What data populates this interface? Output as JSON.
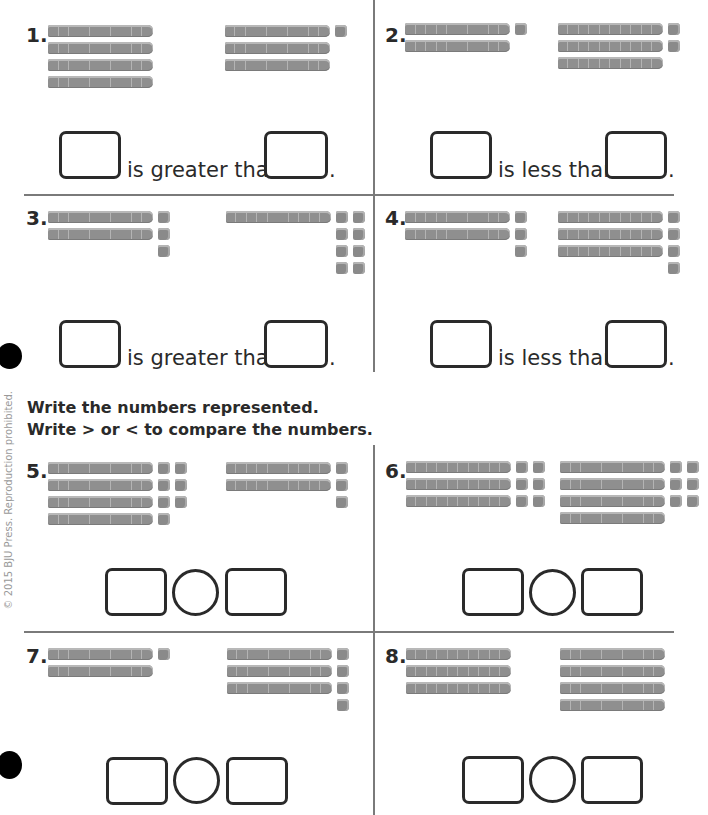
{
  "instructions": {
    "line1": "Write the numbers represented.",
    "line2": "Write > or < to compare the numbers."
  },
  "copyright": "© 2015 BJU Press. Reproduction prohibited.",
  "section_a": {
    "problems": [
      {
        "number": "1.",
        "phrase": "is greater than",
        "left": {
          "tens": 4,
          "ones": 0,
          "value": 40
        },
        "right": {
          "tens": 3,
          "ones": 1,
          "value": 31
        },
        "answer_left": "",
        "answer_right": ""
      },
      {
        "number": "2.",
        "phrase": "is less than",
        "left": {
          "tens": 2,
          "ones": 1,
          "value": 21
        },
        "right": {
          "tens": 3,
          "ones": 2,
          "value": 32
        },
        "answer_left": "",
        "answer_right": ""
      },
      {
        "number": "3.",
        "phrase": "is greater than",
        "left": {
          "tens": 2,
          "ones": 3,
          "value": 23
        },
        "right": {
          "tens": 1,
          "ones": 8,
          "value": 18
        },
        "answer_left": "",
        "answer_right": ""
      },
      {
        "number": "4.",
        "phrase": "is less than",
        "left": {
          "tens": 2,
          "ones": 3,
          "value": 23
        },
        "right": {
          "tens": 3,
          "ones": 4,
          "value": 34
        },
        "answer_left": "",
        "answer_right": ""
      }
    ],
    "period": "."
  },
  "section_b": {
    "problems": [
      {
        "number": "5.",
        "left": {
          "tens": 4,
          "ones": 7,
          "value": 47
        },
        "right": {
          "tens": 2,
          "ones": 3,
          "value": 23
        },
        "answer_left": "",
        "symbol": "",
        "answer_right": ""
      },
      {
        "number": "6.",
        "left": {
          "tens": 3,
          "ones": 6,
          "value": 36
        },
        "right": {
          "tens": 4,
          "ones": 6,
          "value": 46
        },
        "answer_left": "",
        "symbol": "",
        "answer_right": ""
      },
      {
        "number": "7.",
        "left": {
          "tens": 2,
          "ones": 1,
          "value": 21
        },
        "right": {
          "tens": 3,
          "ones": 4,
          "value": 34
        },
        "answer_left": "",
        "symbol": "",
        "answer_right": ""
      },
      {
        "number": "8.",
        "left": {
          "tens": 3,
          "ones": 0,
          "value": 30
        },
        "right": {
          "tens": 4,
          "ones": 0,
          "value": 40
        },
        "answer_left": "",
        "symbol": "",
        "answer_right": ""
      }
    ]
  },
  "colors": {
    "block": "#8f8f8f",
    "line": "#7a7a7a",
    "ink": "#2a2a2a"
  }
}
